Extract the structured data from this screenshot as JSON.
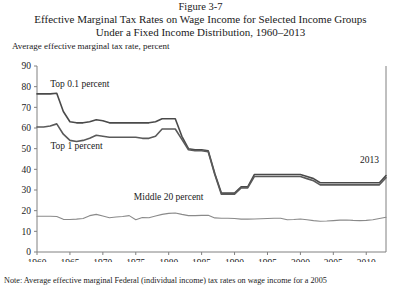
{
  "figure": {
    "number": "Figure 3-7",
    "title_line1": "Effective Marginal Tax Rates on Wage Income for Selected Income Groups",
    "title_line2": "Under a Fixed Income Distribution, 1960–2013",
    "y_axis_caption": "Average effective marginal tax rate, percent",
    "note": "Note: Average effective marginal Federal (individual income) tax rates on wage income for a 2005"
  },
  "chart_data": {
    "type": "line",
    "xlabel": "",
    "ylabel": "Average effective marginal tax rate, percent",
    "xlim": [
      1960,
      2013
    ],
    "ylim": [
      0,
      90
    ],
    "ytick_values": [
      0,
      10,
      20,
      30,
      40,
      50,
      60,
      70,
      80,
      90
    ],
    "xtick_values": [
      1960,
      1965,
      1970,
      1975,
      1980,
      1985,
      1990,
      1995,
      2000,
      2005,
      2010
    ],
    "xtick_labels": [
      "1960",
      "1965",
      "1970",
      "1975",
      "1980",
      "1985",
      "1990",
      "1995",
      "2000",
      "2005",
      "2010"
    ],
    "grid": false,
    "legend": "inline-annotations",
    "annotations": [
      {
        "text": "Top 0.1 percent",
        "x": 1966.5,
        "y": 80
      },
      {
        "text": "Top 1 percent",
        "x": 1966.0,
        "y": 50
      },
      {
        "text": "Middle 20 percent",
        "x": 1980.0,
        "y": 25
      },
      {
        "text": "2013",
        "x": 2010.5,
        "y": 43
      }
    ],
    "x": [
      1960,
      1961,
      1962,
      1963,
      1964,
      1965,
      1966,
      1967,
      1968,
      1969,
      1970,
      1971,
      1972,
      1973,
      1974,
      1975,
      1976,
      1977,
      1978,
      1979,
      1980,
      1981,
      1982,
      1983,
      1984,
      1985,
      1986,
      1987,
      1988,
      1989,
      1990,
      1991,
      1992,
      1993,
      1994,
      1995,
      1996,
      1997,
      1998,
      1999,
      2000,
      2001,
      2002,
      2003,
      2004,
      2005,
      2006,
      2007,
      2008,
      2009,
      2010,
      2011,
      2012,
      2013
    ],
    "series": [
      {
        "name": "Top 0.1 percent",
        "color": "#4a4a4a",
        "values": [
          76.5,
          76.5,
          76.5,
          76.8,
          68.0,
          63.0,
          62.5,
          62.5,
          63.0,
          64.0,
          63.5,
          62.5,
          62.5,
          62.5,
          62.5,
          62.5,
          62.5,
          62.5,
          63.0,
          64.5,
          64.5,
          64.5,
          56.0,
          50.0,
          49.5,
          49.5,
          49.0,
          38.0,
          28.5,
          28.5,
          28.5,
          31.5,
          31.5,
          37.5,
          37.5,
          37.5,
          37.5,
          37.5,
          37.5,
          37.5,
          37.5,
          36.5,
          35.5,
          33.5,
          33.5,
          33.5,
          33.5,
          33.5,
          33.5,
          33.5,
          33.5,
          33.5,
          33.5,
          37.0
        ]
      },
      {
        "name": "Top 1 percent",
        "color": "#5a5a5a",
        "values": [
          60.5,
          60.5,
          61.0,
          62.0,
          57.0,
          54.0,
          53.5,
          54.0,
          55.0,
          56.5,
          56.0,
          55.5,
          55.5,
          55.5,
          55.5,
          55.5,
          55.0,
          55.0,
          56.0,
          59.5,
          59.5,
          59.5,
          54.5,
          49.5,
          49.0,
          49.0,
          48.5,
          37.5,
          28.0,
          28.0,
          28.0,
          31.0,
          31.0,
          36.5,
          36.5,
          36.5,
          36.5,
          36.5,
          36.5,
          36.5,
          36.5,
          35.5,
          34.5,
          32.5,
          32.5,
          32.5,
          32.5,
          32.5,
          32.5,
          32.5,
          32.5,
          32.5,
          32.5,
          36.0
        ]
      },
      {
        "name": "Middle 20 percent",
        "color": "#8a8a8a",
        "values": [
          17.3,
          17.3,
          17.3,
          17.2,
          15.8,
          15.7,
          15.9,
          16.2,
          17.6,
          18.2,
          17.4,
          16.6,
          16.9,
          17.2,
          17.6,
          15.6,
          16.7,
          16.6,
          17.4,
          18.2,
          18.7,
          18.9,
          18.2,
          17.6,
          17.6,
          17.7,
          17.8,
          16.5,
          16.3,
          16.3,
          16.2,
          15.9,
          15.9,
          16.0,
          16.1,
          16.2,
          16.3,
          16.3,
          15.6,
          15.7,
          16.0,
          15.6,
          15.2,
          14.9,
          15.0,
          15.2,
          15.4,
          15.5,
          15.3,
          15.2,
          15.3,
          15.6,
          16.2,
          16.8
        ]
      }
    ]
  }
}
